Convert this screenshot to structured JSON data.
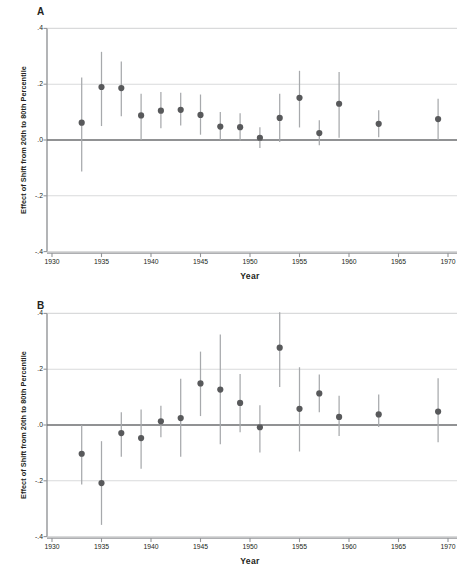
{
  "figure": {
    "panel_a_label": "A",
    "panel_b_label": "B",
    "axis_ylabel": "Effect of Shift from 20th to 80th Percentile",
    "axis_xlabel": "Year",
    "marker_color": "#58595b",
    "whisker_color": "#a7a9ac",
    "gridline_color": "#d9dadb",
    "axis_color": "#939598",
    "zeroline_color": "#6d6e71"
  },
  "chart_data": [
    {
      "type": "scatter",
      "panel": "A",
      "title": "",
      "xlabel": "Year",
      "ylabel": "Effect of Shift from 20th to 80th Percentile",
      "xlim": [
        1929,
        1971
      ],
      "ylim": [
        -0.4,
        0.4
      ],
      "xticks": [
        1930,
        1935,
        1940,
        1945,
        1950,
        1955,
        1960,
        1965,
        1970
      ],
      "xtick_labels": [
        "1930",
        "1935",
        "1940",
        "1945",
        "1950",
        "1955",
        "1960",
        "1965",
        "1970"
      ],
      "yticks": [
        0.4,
        0.2,
        0.0,
        -0.2,
        -0.4
      ],
      "ytick_labels": [
        ".4",
        ".2",
        ".0",
        "-.2",
        "-.4"
      ],
      "grid": true,
      "legend": "none",
      "reference_line": 0.0,
      "x": [
        1933,
        1935,
        1937,
        1939,
        1941,
        1943,
        1945,
        1947,
        1949,
        1951,
        1953,
        1955,
        1957,
        1959,
        1963,
        1969
      ],
      "values": [
        0.062,
        0.19,
        0.186,
        0.088,
        0.105,
        0.108,
        0.09,
        0.048,
        0.046,
        0.008,
        0.079,
        0.151,
        0.025,
        0.13,
        0.058,
        0.075
      ],
      "ci_low": [
        -0.113,
        0.05,
        0.085,
        0.0,
        0.042,
        0.052,
        0.019,
        0.0,
        -0.002,
        -0.029,
        -0.007,
        0.045,
        -0.019,
        0.008,
        0.01,
        0.0
      ],
      "ci_high": [
        0.224,
        0.316,
        0.281,
        0.166,
        0.172,
        0.169,
        0.163,
        0.1,
        0.096,
        0.046,
        0.166,
        0.248,
        0.071,
        0.244,
        0.107,
        0.148
      ]
    },
    {
      "type": "scatter",
      "panel": "B",
      "title": "",
      "xlabel": "Year",
      "ylabel": "Effect of Shift from 20th to 80th Percentile",
      "xlim": [
        1929,
        1971
      ],
      "ylim": [
        -0.4,
        0.4
      ],
      "xticks": [
        1930,
        1935,
        1940,
        1945,
        1950,
        1955,
        1960,
        1965,
        1970
      ],
      "xtick_labels": [
        "1930",
        "1935",
        "1940",
        "1945",
        "1950",
        "1955",
        "1960",
        "1965",
        "1970"
      ],
      "yticks": [
        0.4,
        0.2,
        0.0,
        -0.2,
        -0.4
      ],
      "ytick_labels": [
        ".4",
        ".2",
        ".0",
        "-.2",
        "-.4"
      ],
      "grid": true,
      "legend": "none",
      "reference_line": 0.0,
      "x": [
        1933,
        1935,
        1937,
        1939,
        1941,
        1943,
        1945,
        1947,
        1949,
        1951,
        1953,
        1955,
        1957,
        1959,
        1963,
        1969
      ],
      "values": [
        -0.103,
        -0.208,
        -0.029,
        -0.047,
        0.013,
        0.025,
        0.149,
        0.127,
        0.079,
        -0.008,
        0.277,
        0.058,
        0.113,
        0.029,
        0.038,
        0.048
      ],
      "ci_low": [
        -0.213,
        -0.358,
        -0.114,
        -0.157,
        -0.044,
        -0.114,
        0.032,
        -0.069,
        -0.026,
        -0.099,
        0.136,
        -0.095,
        0.046,
        -0.039,
        -0.007,
        -0.062
      ],
      "ci_high": [
        0.0,
        -0.058,
        0.046,
        0.056,
        0.069,
        0.166,
        0.263,
        0.324,
        0.183,
        0.071,
        0.404,
        0.207,
        0.181,
        0.105,
        0.109,
        0.168
      ]
    }
  ]
}
